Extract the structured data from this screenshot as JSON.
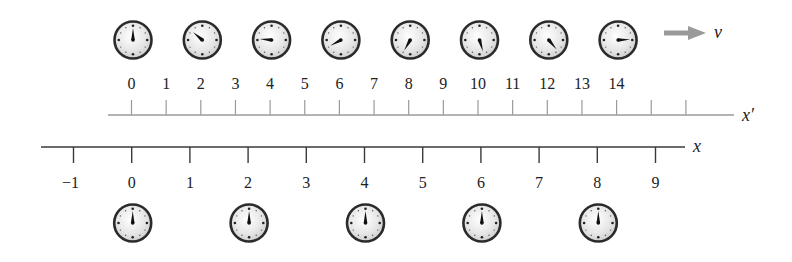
{
  "diagram": {
    "moving_frame": {
      "axis_label": "x′",
      "velocity_label": "v",
      "arrow_color": "#9a9a9a",
      "axis_color": "#9a9a9a",
      "tick_labels": [
        "0",
        "1",
        "2",
        "3",
        "4",
        "5",
        "6",
        "7",
        "8",
        "9",
        "10",
        "11",
        "12",
        "13",
        "14"
      ],
      "unlabeled_ticks": 2,
      "clocks": [
        {
          "position": 0,
          "hand_angle_deg": 0
        },
        {
          "position": 2,
          "hand_angle_deg": -50
        },
        {
          "position": 4,
          "hand_angle_deg": -85
        },
        {
          "position": 6,
          "hand_angle_deg": -118
        },
        {
          "position": 8,
          "hand_angle_deg": -150
        },
        {
          "position": 10,
          "hand_angle_deg": 163
        },
        {
          "position": 12,
          "hand_angle_deg": 140
        },
        {
          "position": 14,
          "hand_angle_deg": 88
        }
      ]
    },
    "rest_frame": {
      "axis_label": "x",
      "axis_color": "#3a3a3a",
      "tick_labels": [
        "−1",
        "0",
        "1",
        "2",
        "3",
        "4",
        "5",
        "6",
        "7",
        "8",
        "9"
      ],
      "clocks": [
        {
          "position": 0,
          "hand_angle_deg": 0
        },
        {
          "position": 2,
          "hand_angle_deg": 0
        },
        {
          "position": 4,
          "hand_angle_deg": 0
        },
        {
          "position": 6,
          "hand_angle_deg": 0
        },
        {
          "position": 8,
          "hand_angle_deg": 0
        }
      ]
    }
  }
}
